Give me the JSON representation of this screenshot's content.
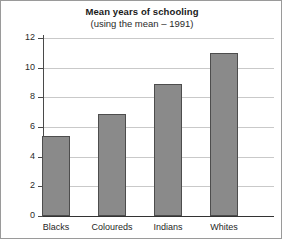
{
  "chart_data": {
    "type": "bar",
    "title": "Mean years of schooling",
    "subtitle": "(using the mean – 1991)",
    "xlabel": "",
    "ylabel": "",
    "categories": [
      "Blacks",
      "Coloureds",
      "Indians",
      "Whites"
    ],
    "values": [
      5.4,
      6.9,
      8.9,
      11.0
    ],
    "ylim": [
      0,
      12
    ],
    "yticks": [
      0,
      2,
      4,
      6,
      8,
      10,
      12
    ],
    "ytick_labels": [
      "0",
      "2",
      "4",
      "6",
      "8",
      "10",
      "12"
    ],
    "grid": true,
    "legend": false,
    "legend_position": "none",
    "series": [
      {
        "name": "Mean years of schooling",
        "values": [
          5.4,
          6.9,
          8.9,
          11.0
        ]
      }
    ],
    "colors": {
      "bar_fill": "#8a8a8a",
      "bar_border": "#4d4d4d",
      "gridline": "#c9c9c9",
      "axis": "#333333",
      "text": "#1f1f1f",
      "background": "#ffffff",
      "frame_border": "#9a9a9a"
    }
  }
}
